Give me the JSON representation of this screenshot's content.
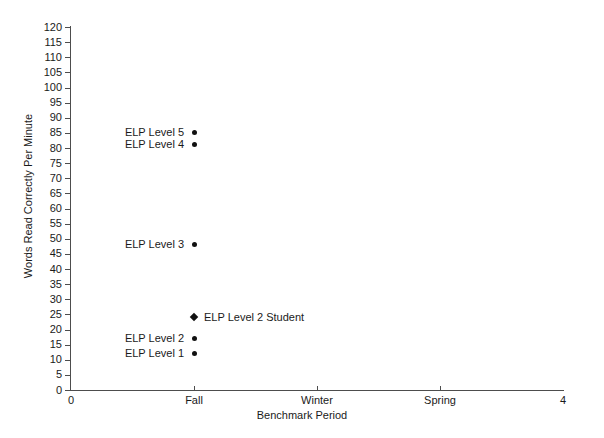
{
  "chart_data": {
    "type": "scatter",
    "title": "",
    "xlabel": "Benchmark Period",
    "ylabel": "Words Read Correctly Per Minute",
    "xlim": [
      0,
      4
    ],
    "ylim": [
      0,
      120
    ],
    "grid": false,
    "legend_position": "none",
    "x_tick_values": [
      0,
      1,
      2,
      3,
      4
    ],
    "x_tick_labels": [
      "0",
      "Fall",
      "Winter",
      "Spring",
      "4"
    ],
    "y_tick_values": [
      0,
      5,
      10,
      15,
      20,
      25,
      30,
      35,
      40,
      45,
      50,
      55,
      60,
      65,
      70,
      75,
      80,
      85,
      90,
      95,
      100,
      105,
      110,
      115,
      120
    ],
    "y_tick_labels": [
      "0",
      "5",
      "10",
      "15",
      "20",
      "25",
      "30",
      "35",
      "40",
      "45",
      "50",
      "55",
      "60",
      "65",
      "70",
      "75",
      "80",
      "85",
      "90",
      "95",
      "100",
      "105",
      "110",
      "115",
      "120"
    ],
    "marker_color": "#111111",
    "axis_color": "#4d4d4d",
    "points": [
      {
        "label": "ELP Level 5",
        "x": 1,
        "y": 85,
        "marker": "circle",
        "label_side": "left"
      },
      {
        "label": "ELP Level 4",
        "x": 1,
        "y": 81,
        "marker": "circle",
        "label_side": "left"
      },
      {
        "label": "ELP Level 3",
        "x": 1,
        "y": 48,
        "marker": "circle",
        "label_side": "left"
      },
      {
        "label": "ELP Level 2 Student",
        "x": 1,
        "y": 24,
        "marker": "diamond",
        "label_side": "right"
      },
      {
        "label": "ELP Level 2",
        "x": 1,
        "y": 17,
        "marker": "circle",
        "label_side": "left"
      },
      {
        "label": "ELP Level 1",
        "x": 1,
        "y": 12,
        "marker": "circle",
        "label_side": "left"
      }
    ]
  }
}
